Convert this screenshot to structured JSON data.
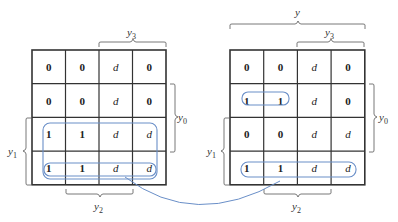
{
  "diagram": {
    "type": "karnaugh-map-pair",
    "colors": {
      "grid": "#333333",
      "loop": "#6a8fc8",
      "text": "#222222"
    },
    "left_map": {
      "cells": [
        [
          "0",
          "0",
          "d",
          "0"
        ],
        [
          "0",
          "0",
          "d",
          "0"
        ],
        [
          "1",
          "1",
          "d",
          "d"
        ],
        [
          "1",
          "1",
          "d",
          "d"
        ]
      ],
      "labels": {
        "top": "y3",
        "right": "y0",
        "left": "y1",
        "bottom": "y2"
      }
    },
    "right_map": {
      "cells": [
        [
          "0",
          "0",
          "d",
          "0"
        ],
        [
          "1",
          "1",
          "d",
          "0"
        ],
        [
          "0",
          "0",
          "d",
          "d"
        ],
        [
          "1",
          "1",
          "d",
          "d"
        ]
      ],
      "labels": {
        "top_outer": "y",
        "top": "y3",
        "right": "y0",
        "left": "y1",
        "bottom": "y2"
      }
    },
    "connector": "curved arrow from left map row 4 loop to right map row 4 loop"
  }
}
